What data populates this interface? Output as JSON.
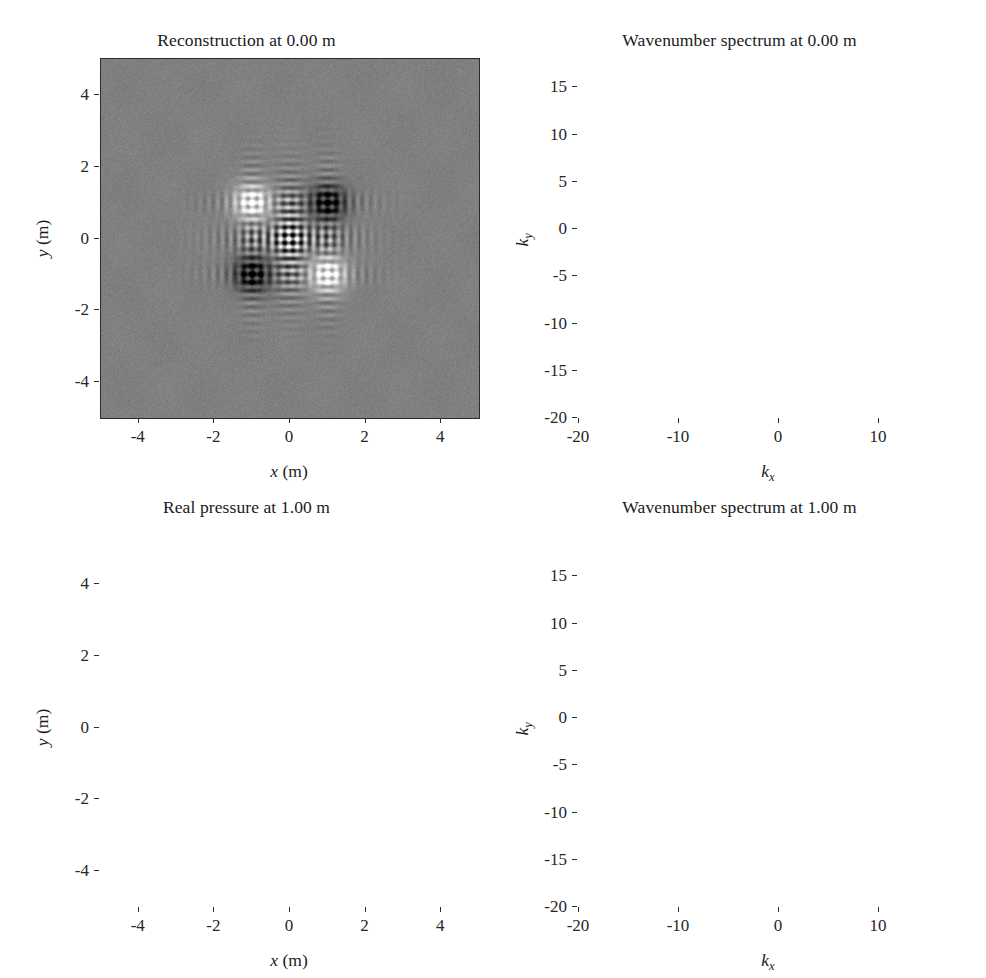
{
  "figure": {
    "width": 986,
    "height": 978,
    "background": "#ffffff",
    "layout": "2x2 grid of grayscale image (pcolor) panels"
  },
  "panels": [
    {
      "id": "top-left",
      "title": "Reconstruction at 0.00 m",
      "xlabel_var": "x",
      "xlabel_unit": "(m)",
      "ylabel_var": "y",
      "ylabel_unit": "(m)",
      "xticks": [
        "-4",
        "-2",
        "0",
        "2",
        "4"
      ],
      "yticks": [
        "4",
        "2",
        "0",
        "-2",
        "-4"
      ]
    },
    {
      "id": "top-right",
      "title": "Wavenumber spectrum at 0.00 m",
      "xlabel_var": "k",
      "xlabel_sub": "x",
      "xlabel_unit": "",
      "ylabel_var": "k",
      "ylabel_sub": "y",
      "ylabel_unit": "",
      "xticks": [
        "-20",
        "-10",
        "0",
        "10"
      ],
      "yticks": [
        "15",
        "10",
        "5",
        "0",
        "-5",
        "-10",
        "-15",
        "-20"
      ]
    },
    {
      "id": "bottom-left",
      "title": "Real pressure at 1.00 m",
      "xlabel_var": "x",
      "xlabel_unit": "(m)",
      "ylabel_var": "y",
      "ylabel_unit": "(m)",
      "xticks": [
        "-4",
        "-2",
        "0",
        "2",
        "4"
      ],
      "yticks": [
        "4",
        "2",
        "0",
        "-2",
        "-4"
      ]
    },
    {
      "id": "bottom-right",
      "title": "Wavenumber spectrum at 1.00 m",
      "xlabel_var": "k",
      "xlabel_sub": "x",
      "xlabel_unit": "",
      "ylabel_var": "k",
      "ylabel_sub": "y",
      "ylabel_unit": "",
      "xticks": [
        "-20",
        "-10",
        "0",
        "10"
      ],
      "yticks": [
        "15",
        "10",
        "5",
        "0",
        "-5",
        "-10",
        "-15",
        "-20"
      ]
    }
  ],
  "chart_data": [
    {
      "type": "heatmap",
      "panel": "top-left",
      "title": "Reconstruction at 0.00 m",
      "xlabel": "x (m)",
      "ylabel": "y (m)",
      "xlim": [
        -5,
        5
      ],
      "ylim": [
        -5,
        5
      ],
      "xticks": [
        -4,
        -2,
        0,
        2,
        4
      ],
      "yticks": [
        -4,
        -2,
        0,
        2,
        4
      ],
      "grid": false,
      "colormap": "gray",
      "background_level": 0.5,
      "description": "Reconstructed acoustic field at the source plane: four tightly focused monopole spots on a uniform mid-gray background, with cross-shaped (vertical and horizontal) fringe artefacts through the origin.",
      "features": [
        {
          "kind": "source-spot",
          "x": -1.0,
          "y": 1.0,
          "polarity": "bright",
          "amplitude": 1.0,
          "radius": 0.35
        },
        {
          "kind": "source-spot",
          "x": 1.0,
          "y": 1.0,
          "polarity": "dark",
          "amplitude": -1.0,
          "radius": 0.35
        },
        {
          "kind": "source-spot",
          "x": -1.0,
          "y": -1.0,
          "polarity": "dark",
          "amplitude": -1.0,
          "radius": 0.35
        },
        {
          "kind": "source-spot",
          "x": 1.0,
          "y": -1.0,
          "polarity": "bright",
          "amplitude": 1.0,
          "radius": 0.35
        },
        {
          "kind": "fringe-cross",
          "center_x": 0.0,
          "center_y": 0.0,
          "extent": 2.0,
          "fringe_period": 0.22
        }
      ]
    },
    {
      "type": "heatmap",
      "panel": "top-right",
      "title": "Wavenumber spectrum at 0.00 m",
      "xlabel": "k_x",
      "ylabel": "k_y",
      "xlim": [
        -20,
        18
      ],
      "ylim": [
        -20,
        18
      ],
      "xticks": [
        -20,
        -10,
        0,
        10
      ],
      "yticks": [
        -20,
        -15,
        -10,
        -5,
        0,
        5,
        10,
        15
      ],
      "grid": false,
      "colormap": "gray",
      "background_level": 0.55,
      "description": "Wavenumber (angular) spectrum back-propagated to 0.00 m: a square lattice of bright lobes spaced about 3.1 rad/m inside the radiation circle, superposed on bright horizontal and vertical bands that extend to the edges (evanescent amplification artefacts).",
      "lattice_spacing_kx": 3.1,
      "lattice_spacing_ky": 3.1,
      "radiation_circle_radius": 12.0,
      "band_kx": [
        -9.3,
        -6.2,
        -3.1,
        0,
        3.1,
        6.2,
        9.3
      ],
      "band_ky": [
        -9.3,
        -6.2,
        -3.1,
        0,
        3.1,
        6.2,
        9.3
      ]
    },
    {
      "type": "heatmap",
      "panel": "bottom-left",
      "title": "Real pressure at 1.00 m",
      "xlabel": "x (m)",
      "ylabel": "y (m)",
      "xlim": [
        -5,
        5
      ],
      "ylim": [
        -5,
        5
      ],
      "xticks": [
        -4,
        -2,
        0,
        2,
        4
      ],
      "yticks": [
        -4,
        -2,
        0,
        2,
        4
      ],
      "grid": false,
      "colormap": "gray",
      "background_level": 0.5,
      "description": "Real part of the measured pressure on the hologram plane 1.00 m from the sources: overlapping circular interference rings radiating from the four source positions, forming a flower-like pattern near the centre that decays into fine concentric ripples toward the edges.",
      "features": [
        {
          "kind": "monopole",
          "x": -1.0,
          "y": 1.0,
          "phase": 0.0,
          "amplitude": 1.0
        },
        {
          "kind": "monopole",
          "x": 1.0,
          "y": 1.0,
          "phase": 3.14159,
          "amplitude": 1.0
        },
        {
          "kind": "monopole",
          "x": -1.0,
          "y": -1.0,
          "phase": 3.14159,
          "amplitude": 1.0
        },
        {
          "kind": "monopole",
          "x": 1.0,
          "y": -1.0,
          "phase": 0.0,
          "amplitude": 1.0
        }
      ],
      "ring_wavelength": 0.52
    },
    {
      "type": "heatmap",
      "panel": "bottom-right",
      "title": "Wavenumber spectrum at 1.00 m",
      "xlabel": "k_x",
      "ylabel": "k_y",
      "xlim": [
        -20,
        18
      ],
      "ylim": [
        -20,
        18
      ],
      "xticks": [
        -20,
        -10,
        0,
        10
      ],
      "yticks": [
        -20,
        -15,
        -10,
        -5,
        0,
        5,
        10,
        15
      ],
      "grid": false,
      "colormap": "gray",
      "background_level": 0.06,
      "description": "Measured wavenumber spectrum at 1.00 m: a filled circular disk of bright lattice lobes confined inside the radiation circle (|k| < ~12 rad/m) on a near-black noise background; energy outside the circle is evanescent and has decayed away.",
      "lattice_spacing_kx": 3.1,
      "lattice_spacing_ky": 3.1,
      "radiation_circle_radius": 12.0,
      "brightest_lobes": [
        {
          "kx": -5.0,
          "ky": 11.0
        },
        {
          "kx": 5.0,
          "ky": 11.0
        },
        {
          "kx": -11.5,
          "ky": 5.0
        },
        {
          "kx": 11.0,
          "ky": 5.0
        },
        {
          "kx": -11.5,
          "ky": -5.0
        },
        {
          "kx": 11.0,
          "ky": -5.0
        },
        {
          "kx": -5.0,
          "ky": -11.0
        },
        {
          "kx": 5.0,
          "ky": -11.0
        }
      ],
      "artefact": "faint dark horizontal streak near k_y = 6"
    }
  ]
}
